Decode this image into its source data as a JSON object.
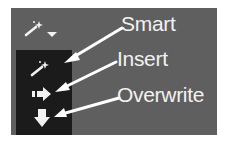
{
  "toolbar": {
    "edit_mode_button": {
      "icon": "magic-wand-icon",
      "has_dropdown": true
    }
  },
  "menu": {
    "items": [
      {
        "id": "smart",
        "icon": "magic-wand-icon",
        "label": "Smart"
      },
      {
        "id": "insert",
        "icon": "arrow-right-icon",
        "label": "Insert"
      },
      {
        "id": "overwrite",
        "icon": "arrow-down-icon",
        "label": "Overwrite"
      }
    ]
  },
  "colors": {
    "panel_bg": "#5f5f5f",
    "menu_bg": "#1b1b1b",
    "icon": "#f2f2f2",
    "annotation": "#ffffff"
  }
}
